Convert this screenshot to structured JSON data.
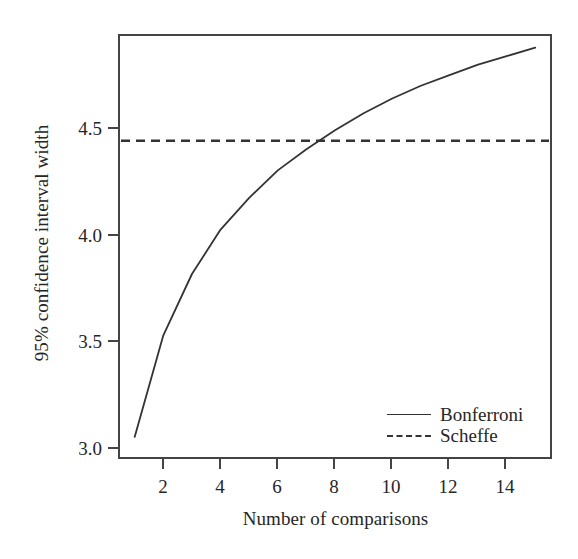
{
  "chart_data": {
    "type": "line",
    "title": "",
    "xlabel": "Number of comparisons",
    "ylabel": "95% confidence interval width",
    "xlim": [
      0.45,
      15.55
    ],
    "ylim": [
      2.92,
      4.92
    ],
    "grid": false,
    "legend_position": "bottom-right",
    "xticks": [
      2,
      4,
      6,
      8,
      10,
      12,
      14
    ],
    "xtick_labels": [
      "2",
      "4",
      "6",
      "8",
      "10",
      "12",
      "14"
    ],
    "yticks": [
      3.0,
      3.5,
      4.0,
      4.5
    ],
    "ytick_labels": [
      "3.0",
      "3.5",
      "4.0",
      "4.5"
    ],
    "x": [
      1,
      2,
      3,
      4,
      5,
      6,
      7,
      8,
      9,
      10,
      11,
      12,
      13,
      14,
      15
    ],
    "series": [
      {
        "name": "Bonferroni",
        "style": "solid",
        "color": "#333333",
        "values": [
          3.02,
          3.5,
          3.79,
          4.0,
          4.15,
          4.28,
          4.38,
          4.47,
          4.55,
          4.62,
          4.68,
          4.73,
          4.78,
          4.82,
          4.86
        ]
      },
      {
        "name": "Scheffe",
        "style": "dashed",
        "color": "#333333",
        "constant": 4.42,
        "values": [
          4.42,
          4.42,
          4.42,
          4.42,
          4.42,
          4.42,
          4.42,
          4.42,
          4.42,
          4.42,
          4.42,
          4.42,
          4.42,
          4.42,
          4.42
        ]
      }
    ],
    "annotations": {
      "crossing_x": 7.75,
      "crossing_y": 4.42
    }
  },
  "axes": {
    "y_title": "95% confidence interval width",
    "x_title": "Number of comparisons",
    "y_tick_labels": [
      "4.5",
      "4.0",
      "3.5",
      "3.0"
    ],
    "x_tick_labels": [
      "2",
      "4",
      "6",
      "8",
      "10",
      "12",
      "14"
    ]
  },
  "legend": {
    "items": [
      {
        "label": "Bonferroni",
        "key": "solid-line-key"
      },
      {
        "label": "Scheffe",
        "key": "dashed-line-key"
      }
    ]
  },
  "style": {
    "frame_color": "#444444",
    "line_color": "#333333",
    "background": "#ffffff",
    "text_color": "#262626"
  }
}
